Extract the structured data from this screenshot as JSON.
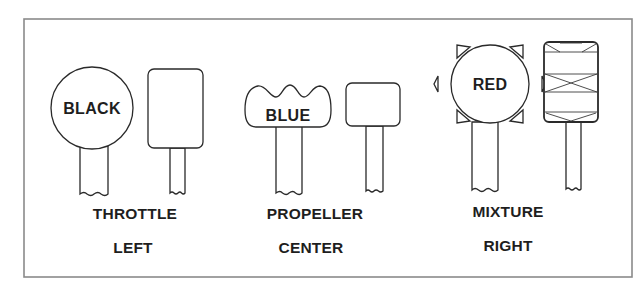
{
  "diagram": {
    "colors": {
      "line": "#2a2a2a",
      "frame": "#8a8a8a",
      "background": "#ffffff",
      "text": "#1e1e1e"
    },
    "controls": [
      {
        "name": "THROTTLE",
        "position": "LEFT",
        "knob_label": "BLACK",
        "knob_shape": "round knob",
        "alt_knob_shape": "rounded rectangle"
      },
      {
        "name": "PROPELLER",
        "position": "CENTER",
        "knob_label": "BLUE",
        "knob_shape": "scalloped / wavy-top knob",
        "alt_knob_shape": "rounded square"
      },
      {
        "name": "MIXTURE",
        "position": "RIGHT",
        "knob_label": "RED",
        "knob_shape": "round knob with six triangular points",
        "alt_knob_shape": "knurled (crosshatched) rectangle"
      }
    ]
  }
}
